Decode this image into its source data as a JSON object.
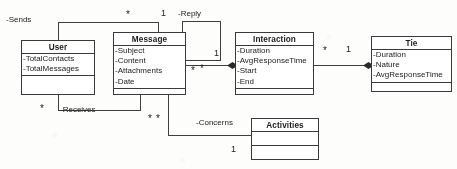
{
  "diagram": {
    "type": "uml-class-diagram",
    "title": "",
    "classes": [
      {
        "id": "user",
        "name": "User",
        "attributes": [
          "-TotalContacts",
          "-TotalMessages"
        ],
        "operations": []
      },
      {
        "id": "message",
        "name": "Message",
        "attributes": [
          "-Subject",
          "-Content",
          "-Attachments",
          "-Date"
        ],
        "operations": []
      },
      {
        "id": "interaction",
        "name": "Interaction",
        "attributes": [
          "-Duration",
          "-AvgResponseTime",
          "-Start",
          "-End"
        ],
        "operations": []
      },
      {
        "id": "tie",
        "name": "Tie",
        "attributes": [
          "-Duration",
          "-Nature",
          "-AvgResponseTime"
        ],
        "operations": []
      },
      {
        "id": "activities",
        "name": "Activities",
        "attributes": [],
        "operations": []
      }
    ],
    "associations": [
      {
        "id": "sends",
        "label": "-Sends",
        "from": "user",
        "to": "message",
        "kind": "association",
        "source_multiplicity": "",
        "target_multiplicity": "*"
      },
      {
        "id": "receives",
        "label": "-Receives",
        "from": "user",
        "to": "message",
        "kind": "association",
        "source_multiplicity": "*",
        "target_multiplicity": "*"
      },
      {
        "id": "reply",
        "label": "-Reply",
        "from": "message",
        "to": "message",
        "kind": "self-association",
        "source_multiplicity": "1",
        "target_multiplicity": "*"
      },
      {
        "id": "message-interaction",
        "label": "",
        "from": "message",
        "to": "interaction",
        "kind": "composition",
        "source_multiplicity": "*",
        "target_multiplicity": "1"
      },
      {
        "id": "interaction-tie",
        "label": "",
        "from": "interaction",
        "to": "tie",
        "kind": "composition",
        "source_multiplicity": "*",
        "target_multiplicity": "1"
      },
      {
        "id": "concerns",
        "label": "-Concerns",
        "from": "message",
        "to": "activities",
        "kind": "association",
        "source_multiplicity": "*",
        "target_multiplicity": "1"
      }
    ],
    "multiplicity_markers": {
      "sends_star": "*",
      "reply_one": "1",
      "reply_star": "*",
      "msg_int_one": "1",
      "msg_int_star": "*",
      "int_tie_star": "*",
      "int_tie_one": "1",
      "receives_left_star": "*",
      "receives_right_star": "*",
      "concerns_star": "*",
      "concerns_one": "1"
    },
    "colors": {
      "line": "#3f3f3f",
      "text": "#1b1b1b",
      "box_fill": "#ffffff",
      "background": "#fdfdfc"
    }
  }
}
